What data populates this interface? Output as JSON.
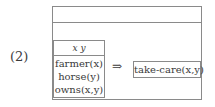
{
  "example_label": "(2)",
  "outer_box": {
    "universe": "",
    "antecedent": {
      "universe": "x y",
      "conditions": [
        "farmer(x)",
        "horse(y)",
        "owns(x,y)"
      ]
    },
    "operator": "⇒",
    "consequent": {
      "conditions": [
        "take-care(x,y)"
      ]
    }
  }
}
